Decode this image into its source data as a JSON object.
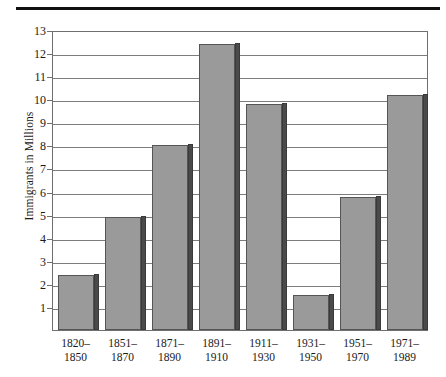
{
  "figure": {
    "kind": "bar-chart",
    "top_rule_color": "#111111",
    "bar_fill_color": "#9a9a9a",
    "bar_edge_color": "#555555",
    "bar_shadow_color": "#4a4a4a",
    "grid_color": "#7d7d7d",
    "background_color": "#ffffff"
  },
  "chart_data": {
    "type": "bar",
    "title": "",
    "xlabel": "",
    "ylabel": "Immigrants in Millions",
    "categories": [
      "1820–\n1850",
      "1851–\n1870",
      "1871–\n1890",
      "1891–\n1910",
      "1911–\n1930",
      "1931–\n1950",
      "1951–\n1970",
      "1971–\n1989"
    ],
    "category_lines": [
      [
        "1820–",
        "1850"
      ],
      [
        "1851–",
        "1870"
      ],
      [
        "1871–",
        "1890"
      ],
      [
        "1891–",
        "1910"
      ],
      [
        "1911–",
        "1930"
      ],
      [
        "1931–",
        "1950"
      ],
      [
        "1951–",
        "1970"
      ],
      [
        "1971–",
        "1989"
      ]
    ],
    "values": [
      2.4,
      4.9,
      8.0,
      12.4,
      9.8,
      1.5,
      5.75,
      10.2
    ],
    "ylim": [
      0,
      13
    ],
    "yticks": [
      1,
      2,
      3,
      4,
      5,
      6,
      7,
      8,
      9,
      10,
      11,
      12,
      13
    ],
    "ytick_labels": [
      "1",
      "2",
      "3",
      "4",
      "5",
      "6",
      "7",
      "8",
      "9",
      "10",
      "11",
      "12",
      "13"
    ],
    "grid": true,
    "grid_axis": "y",
    "legend": null,
    "legend_position": "none",
    "annotations": []
  }
}
